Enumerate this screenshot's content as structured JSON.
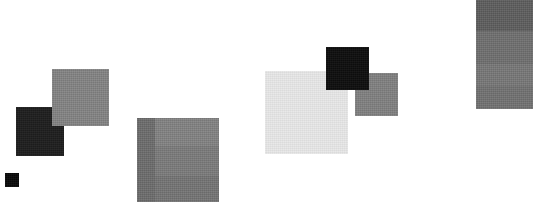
{
  "canvas": {
    "width": 533,
    "height": 202,
    "background": "#ffffff",
    "title": "Grayscale Patch Composition"
  },
  "chart_data": {
    "type": "heatmap",
    "title": "",
    "xlabel": "",
    "ylabel": "",
    "grid": false,
    "legend": "none",
    "xlim": [
      0,
      533
    ],
    "ylim": [
      0,
      202
    ],
    "categories": [
      "tiny-black-square",
      "dark-square-left",
      "mid-gray-square-left",
      "banded-gray-square-center",
      "light-gray-square-center-right",
      "black-square-center-right",
      "mid-gray-square-center-right",
      "banded-gray-column-right"
    ],
    "values": [
      10,
      30,
      131,
      120,
      232,
      14,
      128,
      112
    ],
    "patches": [
      {
        "name": "tiny-black-square",
        "x": 5,
        "y": 173,
        "width": 14,
        "height": 14,
        "fill": "#0a0a0a",
        "gray_value": 10,
        "tone": "black"
      },
      {
        "name": "dark-square-left",
        "x": 16,
        "y": 107,
        "width": 48,
        "height": 49,
        "fill": "#1e1e1e",
        "gray_value": 30,
        "tone": "very-dark"
      },
      {
        "name": "mid-gray-square-left",
        "x": 52,
        "y": 69,
        "width": 57,
        "height": 57,
        "fill": "#838383",
        "gray_value": 131,
        "tone": "mid-gray"
      },
      {
        "name": "banded-gray-square-center",
        "x": 137,
        "y": 118,
        "width": 82,
        "height": 84,
        "fill": "#787878",
        "gray_value": 120,
        "tone": "mid-gray",
        "bands": [
          {
            "name": "left-dark-strip",
            "x": 0,
            "width": 18,
            "fill": "#6c6c6c",
            "gray_value": 108
          },
          {
            "name": "upper-light-band",
            "y": 0,
            "height": 28,
            "fill": "#828282",
            "gray_value": 130
          },
          {
            "name": "mid-band",
            "y": 28,
            "height": 30,
            "fill": "#7b7b7b",
            "gray_value": 123
          },
          {
            "name": "lower-band",
            "y": 58,
            "height": 26,
            "fill": "#747474",
            "gray_value": 116
          }
        ]
      },
      {
        "name": "light-gray-square-center-right",
        "x": 265,
        "y": 71,
        "width": 83,
        "height": 83,
        "fill": "#e8e8e8",
        "gray_value": 232,
        "tone": "very-light"
      },
      {
        "name": "black-square-center-right",
        "x": 326,
        "y": 47,
        "width": 43,
        "height": 43,
        "fill": "#0e0e0e",
        "gray_value": 14,
        "tone": "black"
      },
      {
        "name": "mid-gray-square-center-right",
        "x": 355,
        "y": 73,
        "width": 43,
        "height": 43,
        "fill": "#808080",
        "gray_value": 128,
        "tone": "mid-gray"
      },
      {
        "name": "banded-gray-column-right",
        "x": 476,
        "y": 0,
        "width": 57,
        "height": 109,
        "fill": "#707070",
        "gray_value": 112,
        "tone": "mid-dark-gray",
        "bands": [
          {
            "name": "top-dark-band",
            "y": 0,
            "height": 31,
            "fill": "#5d5d5d",
            "gray_value": 93
          },
          {
            "name": "upper-mid-band",
            "y": 31,
            "height": 33,
            "fill": "#6f6f6f",
            "gray_value": 111
          },
          {
            "name": "lower-mid-band",
            "y": 64,
            "height": 22,
            "fill": "#777777",
            "gray_value": 119
          },
          {
            "name": "bottom-band",
            "y": 86,
            "height": 23,
            "fill": "#717171",
            "gray_value": 113
          }
        ]
      }
    ]
  }
}
